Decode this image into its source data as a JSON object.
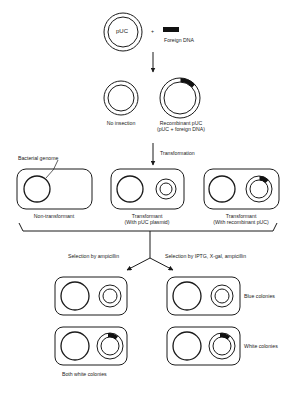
{
  "top": {
    "plasmid_label": "pUC",
    "plus": "+",
    "foreign_dna_label": "Foreign DNA"
  },
  "ligation_products": [
    {
      "label": "No insection"
    },
    {
      "label": "Recombinant pUC",
      "sublabel": "(pUC + foreign DNA)"
    }
  ],
  "step_transformation": "Transformation",
  "bacterial_genome_label": "Bacterial genome",
  "cells": [
    {
      "label": "Non-transformant",
      "sublabel": ""
    },
    {
      "label": "Transformant",
      "sublabel": "(With pUC plasmid)"
    },
    {
      "label": "Transformant",
      "sublabel": "(With recombinant pUC)"
    }
  ],
  "selection": {
    "left": "Selection by ampicillin",
    "right": "Selection by IPTG, X-gal, ampicillin"
  },
  "results": {
    "left_caption": "Both white colonies",
    "blue_label": "Blue colonies",
    "white_label": "White colonies"
  },
  "colors": {
    "line": "#1a1a1a",
    "insert": "#111111",
    "background": "#ffffff"
  }
}
